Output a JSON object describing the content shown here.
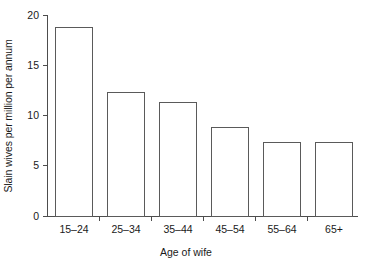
{
  "chart_data": {
    "type": "bar",
    "title": "",
    "subtitle": "",
    "xlabel": "Age of wife",
    "ylabel": "Slain wives per million per annum",
    "categories": [
      "15–24",
      "25–34",
      "35–44",
      "45–54",
      "55–64",
      "65+"
    ],
    "values": [
      18.8,
      12.3,
      11.3,
      8.9,
      7.4,
      7.4
    ],
    "ylim": [
      0,
      20
    ],
    "yticks": [
      0,
      5,
      10,
      15,
      20
    ],
    "ytick_labels": [
      "0",
      "5",
      "10",
      "15",
      "20"
    ],
    "grid": false,
    "legend": null,
    "annotations": [],
    "bar_fill_color": "#ffffff",
    "bar_edge_color": "#5a5a5a",
    "axis_color": "#4d4d4d",
    "background_color": "#ffffff"
  },
  "axis": {
    "y_label": "Slain wives per million per annum",
    "x_label": "Age of wife"
  }
}
